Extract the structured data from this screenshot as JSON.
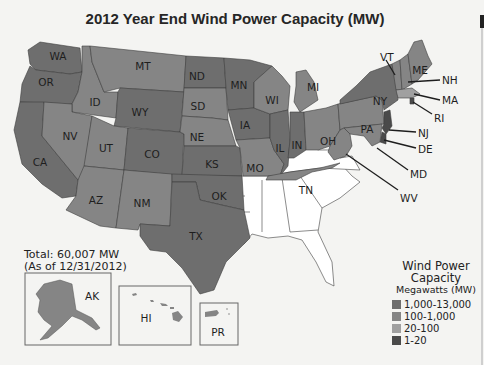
{
  "title": "2012 Year End Wind Power Capacity (MW)",
  "total": {
    "line1": "Total: 60,007 MW",
    "line2": "(As of 12/31/2012)"
  },
  "legend": {
    "title1": "Wind Power",
    "title2": "Capacity",
    "subtitle": "Megawatts (MW)",
    "items": [
      {
        "label": "1,000-13,000",
        "color": "#6e6e6e"
      },
      {
        "label": "100-1,000",
        "color": "#858585"
      },
      {
        "label": "20-100",
        "color": "#a0a0a0"
      },
      {
        "label": "1-20",
        "color": "#4a4a4a"
      }
    ]
  },
  "colors": {
    "none": "#ffffff",
    "high": "#6e6e6e",
    "mid": "#858585",
    "low": "#a0a0a0",
    "min": "#4a4a4a"
  },
  "states": {
    "WA": "WA",
    "OR": "OR",
    "CA": "CA",
    "ID": "ID",
    "NV": "NV",
    "MT": "MT",
    "WY": "WY",
    "UT": "UT",
    "AZ": "AZ",
    "CO": "CO",
    "NM": "NM",
    "ND": "ND",
    "SD": "SD",
    "NE": "NE",
    "KS": "KS",
    "OK": "OK",
    "TX": "TX",
    "MN": "MN",
    "IA": "IA",
    "MO": "MO",
    "WI": "WI",
    "IL": "IL",
    "MI": "MI",
    "IN": "IN",
    "OH": "OH",
    "TN": "TN",
    "PA": "PA",
    "NY": "NY",
    "VT": "VT",
    "ME": "ME",
    "NH": "NH",
    "MA": "MA",
    "RI": "RI",
    "NJ": "NJ",
    "DE": "DE",
    "MD": "MD",
    "WV": "WV"
  },
  "insets": {
    "AK": "AK",
    "HI": "HI",
    "PR": "PR"
  }
}
